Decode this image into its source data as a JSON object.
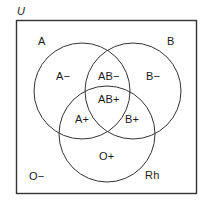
{
  "figure": {
    "type": "venn-diagram",
    "title_label": "U",
    "stroke_color": "#333333",
    "background_color": "#ffffff",
    "text_color": "#1a1a1a"
  },
  "universe": {
    "label": "U",
    "outside_region_label": "O−"
  },
  "sets": [
    {
      "id": "A",
      "label": "A",
      "cx": 82,
      "cy": 91,
      "r": 48
    },
    {
      "id": "B",
      "label": "B",
      "cx": 133,
      "cy": 91,
      "r": 48
    },
    {
      "id": "Rh",
      "label": "Rh",
      "cx": 107,
      "cy": 134,
      "r": 48
    }
  ],
  "set_labels": [
    {
      "name": "set-label-a",
      "text": "A",
      "x": 38,
      "y": 36
    },
    {
      "name": "set-label-b",
      "text": "B",
      "x": 167,
      "y": 36
    },
    {
      "name": "set-label-rh",
      "text": "Rh",
      "x": 145,
      "y": 170
    }
  ],
  "regions": [
    {
      "name": "region-a-minus",
      "text": "A−",
      "x": 56,
      "y": 71
    },
    {
      "name": "region-ab-minus",
      "text": "AB−",
      "x": 98,
      "y": 71
    },
    {
      "name": "region-b-minus",
      "text": "B−",
      "x": 146,
      "y": 71
    },
    {
      "name": "region-ab-plus",
      "text": "AB+",
      "x": 98,
      "y": 94
    },
    {
      "name": "region-a-plus",
      "text": "A+",
      "x": 75,
      "y": 114
    },
    {
      "name": "region-b-plus",
      "text": "B+",
      "x": 125,
      "y": 114
    },
    {
      "name": "region-o-plus",
      "text": "O+",
      "x": 99,
      "y": 151
    },
    {
      "name": "region-o-minus",
      "text": "O−",
      "x": 29,
      "y": 171
    }
  ],
  "universe_box": {
    "x": 16,
    "y": 20,
    "width": 181,
    "height": 174
  },
  "universe_label_position": {
    "x": 17,
    "y": 6
  }
}
